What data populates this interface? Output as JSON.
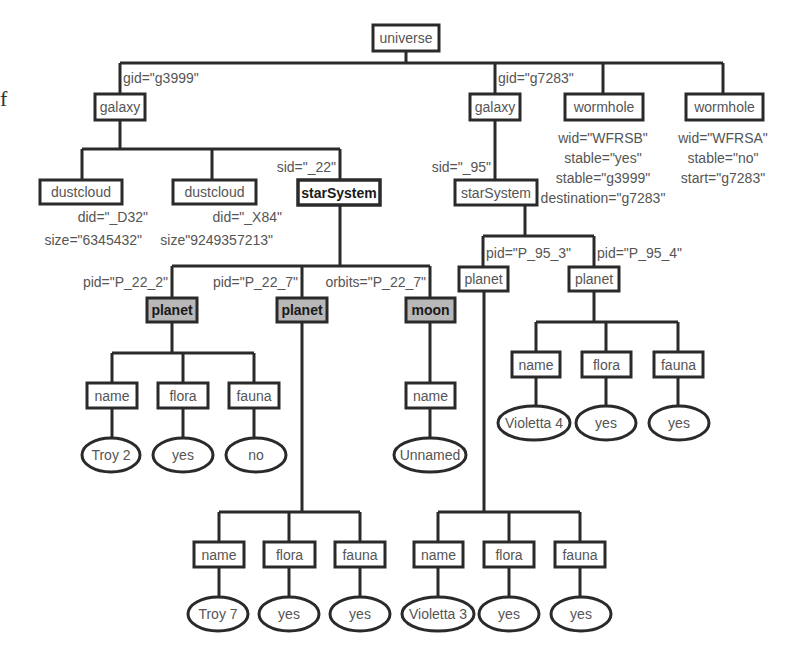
{
  "diagram": {
    "stray_glyph": "f",
    "colors": {
      "line": "#2a2a2a",
      "text": "#555555",
      "box_fill": "#ffffff",
      "highlight_fill": "#b8b8b8",
      "highlight_text": "#1a1a1a"
    },
    "nodes": [
      {
        "id": "universe",
        "label": "universe",
        "shape": "box",
        "x": 373,
        "y": 25,
        "w": 66,
        "h": 26
      },
      {
        "id": "galaxy1",
        "label": "galaxy",
        "shape": "box",
        "x": 95,
        "y": 94,
        "w": 50,
        "h": 26
      },
      {
        "id": "galaxy2",
        "label": "galaxy",
        "shape": "box",
        "x": 470,
        "y": 94,
        "w": 50,
        "h": 26
      },
      {
        "id": "wormhole1",
        "label": "wormhole",
        "shape": "box",
        "x": 565,
        "y": 94,
        "w": 78,
        "h": 26
      },
      {
        "id": "wormhole2",
        "label": "wormhole",
        "shape": "box",
        "x": 686,
        "y": 94,
        "w": 77,
        "h": 26
      },
      {
        "id": "dustcloud1",
        "label": "dustcloud",
        "shape": "box",
        "x": 40,
        "y": 180,
        "w": 82,
        "h": 24
      },
      {
        "id": "dustcloud2",
        "label": "dustcloud",
        "shape": "box",
        "x": 173,
        "y": 180,
        "w": 83,
        "h": 24
      },
      {
        "id": "starSystem1",
        "label": "starSystem",
        "shape": "box",
        "bold": true,
        "x": 298,
        "y": 180,
        "w": 82,
        "h": 25
      },
      {
        "id": "starSystem2",
        "label": "starSystem",
        "shape": "box",
        "x": 455,
        "y": 180,
        "w": 82,
        "h": 25
      },
      {
        "id": "planet1",
        "label": "planet",
        "shape": "box",
        "highlight": true,
        "x": 147,
        "y": 298,
        "w": 50,
        "h": 24
      },
      {
        "id": "planet2",
        "label": "planet",
        "shape": "box",
        "highlight": true,
        "x": 277,
        "y": 298,
        "w": 50,
        "h": 24
      },
      {
        "id": "moon",
        "label": "moon",
        "shape": "box",
        "highlight": true,
        "x": 406,
        "y": 298,
        "w": 49,
        "h": 24
      },
      {
        "id": "planet3",
        "label": "planet",
        "shape": "box",
        "x": 459,
        "y": 267,
        "w": 49,
        "h": 24
      },
      {
        "id": "planet4",
        "label": "planet",
        "shape": "box",
        "x": 569,
        "y": 267,
        "w": 50,
        "h": 24
      },
      {
        "id": "p1_name",
        "label": "name",
        "shape": "box",
        "x": 87,
        "y": 383,
        "w": 50,
        "h": 25
      },
      {
        "id": "p1_flora",
        "label": "flora",
        "shape": "box",
        "x": 158,
        "y": 383,
        "w": 50,
        "h": 25
      },
      {
        "id": "p1_fauna",
        "label": "fauna",
        "shape": "box",
        "x": 229,
        "y": 383,
        "w": 50,
        "h": 25
      },
      {
        "id": "p1_name_v",
        "label": "Troy 2",
        "shape": "ellipse",
        "cx": 111,
        "cy": 455,
        "rx": 29,
        "ry": 17
      },
      {
        "id": "p1_flora_v",
        "label": "yes",
        "shape": "ellipse",
        "cx": 183,
        "cy": 455,
        "rx": 30,
        "ry": 17
      },
      {
        "id": "p1_fauna_v",
        "label": "no",
        "shape": "ellipse",
        "cx": 256,
        "cy": 455,
        "rx": 30,
        "ry": 17
      },
      {
        "id": "m_name",
        "label": "name",
        "shape": "box",
        "x": 406,
        "y": 383,
        "w": 49,
        "h": 25
      },
      {
        "id": "m_name_v",
        "label": "Unnamed",
        "shape": "ellipse",
        "cx": 430,
        "cy": 455,
        "rx": 36,
        "ry": 17
      },
      {
        "id": "p4_name",
        "label": "name",
        "shape": "box",
        "x": 512,
        "y": 352,
        "w": 48,
        "h": 25
      },
      {
        "id": "p4_flora",
        "label": "flora",
        "shape": "box",
        "x": 582,
        "y": 352,
        "w": 49,
        "h": 25
      },
      {
        "id": "p4_fauna",
        "label": "fauna",
        "shape": "box",
        "x": 654,
        "y": 352,
        "w": 49,
        "h": 25
      },
      {
        "id": "p4_name_v",
        "label": "Violetta 4",
        "shape": "ellipse",
        "cx": 534,
        "cy": 423,
        "rx": 36,
        "ry": 17
      },
      {
        "id": "p4_flora_v",
        "label": "yes",
        "shape": "ellipse",
        "cx": 606,
        "cy": 423,
        "rx": 30,
        "ry": 17
      },
      {
        "id": "p4_fauna_v",
        "label": "yes",
        "shape": "ellipse",
        "cx": 679,
        "cy": 423,
        "rx": 30,
        "ry": 17
      },
      {
        "id": "p2_name",
        "label": "name",
        "shape": "box",
        "x": 194,
        "y": 542,
        "w": 50,
        "h": 25
      },
      {
        "id": "p2_flora",
        "label": "flora",
        "shape": "box",
        "x": 264,
        "y": 542,
        "w": 51,
        "h": 25
      },
      {
        "id": "p2_fauna",
        "label": "fauna",
        "shape": "box",
        "x": 335,
        "y": 542,
        "w": 50,
        "h": 25
      },
      {
        "id": "p2_name_v",
        "label": "Troy 7",
        "shape": "ellipse",
        "cx": 218,
        "cy": 614,
        "rx": 30,
        "ry": 17
      },
      {
        "id": "p2_flora_v",
        "label": "yes",
        "shape": "ellipse",
        "cx": 289,
        "cy": 614,
        "rx": 30,
        "ry": 17
      },
      {
        "id": "p2_fauna_v",
        "label": "yes",
        "shape": "ellipse",
        "cx": 360,
        "cy": 614,
        "rx": 30,
        "ry": 17
      },
      {
        "id": "p3_name",
        "label": "name",
        "shape": "box",
        "x": 414,
        "y": 542,
        "w": 49,
        "h": 25
      },
      {
        "id": "p3_flora",
        "label": "flora",
        "shape": "box",
        "x": 484,
        "y": 542,
        "w": 50,
        "h": 25
      },
      {
        "id": "p3_fauna",
        "label": "fauna",
        "shape": "box",
        "x": 555,
        "y": 542,
        "w": 50,
        "h": 25
      },
      {
        "id": "p3_name_v",
        "label": "Violetta 3",
        "shape": "ellipse",
        "cx": 438,
        "cy": 614,
        "rx": 36,
        "ry": 17
      },
      {
        "id": "p3_flora_v",
        "label": "yes",
        "shape": "ellipse",
        "cx": 509,
        "cy": 614,
        "rx": 30,
        "ry": 17
      },
      {
        "id": "p3_fauna_v",
        "label": "yes",
        "shape": "ellipse",
        "cx": 581,
        "cy": 614,
        "rx": 30,
        "ry": 17
      }
    ],
    "edges": [
      "M406,51 V63",
      "M120,63 H723",
      "M120,63 V94",
      "M495,63 V94",
      "M603,63 V94",
      "M723,63 V94",
      "M120,120 V149",
      "M82,149 H340",
      "M82,149 V180",
      "M212,149 V180",
      "M340,149 V180",
      "M495,120 V180",
      "M340,205 V266",
      "M172,266 H430",
      "M172,266 V298",
      "M302,266 V298",
      "M430,266 V298",
      "M525,205 V236",
      "M483,236 H594",
      "M483,236 V267",
      "M594,236 V267",
      "M172,322 V353",
      "M112,353 H254",
      "M112,353 V383",
      "M183,353 V383",
      "M254,353 V383",
      "M112,408 V438",
      "M183,408 V438",
      "M254,408 V438",
      "M430,322 V383",
      "M430,408 V438",
      "M594,291 V322",
      "M536,322 H678",
      "M536,322 V352",
      "M606,322 V352",
      "M678,322 V352",
      "M536,377 V406",
      "M606,377 V406",
      "M678,377 V406",
      "M302,322 V512",
      "M219,512 H360",
      "M219,512 V542",
      "M289,512 V542",
      "M360,512 V542",
      "M219,567 V597",
      "M289,567 V597",
      "M360,567 V597",
      "M484,291 V512",
      "M438,512 H580",
      "M438,512 V542",
      "M509,512 V542",
      "M580,512 V542",
      "M438,567 V597",
      "M509,567 V597",
      "M580,567 V597"
    ],
    "attributes": [
      {
        "for": "galaxy1",
        "text": "gid=\"g3999\"",
        "x": 123,
        "y": 83,
        "anchor": "start"
      },
      {
        "for": "galaxy2",
        "text": "gid=\"g7283\"",
        "x": 498,
        "y": 83,
        "anchor": "start"
      },
      {
        "for": "wormhole1",
        "text": "wid=\"WFRSB\"",
        "x": 603,
        "y": 143,
        "anchor": "middle"
      },
      {
        "for": "wormhole1",
        "text": "stable=\"yes\"",
        "x": 603,
        "y": 163,
        "anchor": "middle"
      },
      {
        "for": "wormhole1",
        "text": "stable=\"g3999\"",
        "x": 603,
        "y": 183,
        "anchor": "middle"
      },
      {
        "for": "wormhole1",
        "text": "destination=\"g7283\"",
        "x": 603,
        "y": 203,
        "anchor": "middle"
      },
      {
        "for": "wormhole2",
        "text": "wid=\"WFRSA\"",
        "x": 723,
        "y": 143,
        "anchor": "middle"
      },
      {
        "for": "wormhole2",
        "text": "stable=\"no\"",
        "x": 723,
        "y": 163,
        "anchor": "middle"
      },
      {
        "for": "wormhole2",
        "text": "start=\"g7283\"",
        "x": 723,
        "y": 183,
        "anchor": "middle"
      },
      {
        "for": "starSystem1",
        "text": "sid=\"_22\"",
        "x": 336,
        "y": 172,
        "anchor": "end"
      },
      {
        "for": "starSystem2",
        "text": "sid=\"_95\"",
        "x": 491,
        "y": 172,
        "anchor": "end"
      },
      {
        "for": "dustcloud1",
        "text": "did=\"_D32\"",
        "x": 148,
        "y": 222,
        "anchor": "end"
      },
      {
        "for": "dustcloud1",
        "text": "size=\"6345432\"",
        "x": 142,
        "y": 245,
        "anchor": "end"
      },
      {
        "for": "dustcloud2",
        "text": "did=\"_X84\"",
        "x": 282,
        "y": 222,
        "anchor": "end"
      },
      {
        "for": "dustcloud2",
        "text": "size\"9249357213\"",
        "x": 273,
        "y": 245,
        "anchor": "end"
      },
      {
        "for": "planet1",
        "text": "pid=\"P_22_2\"",
        "x": 168,
        "y": 287,
        "anchor": "end"
      },
      {
        "for": "planet2",
        "text": "pid=\"P_22_7\"",
        "x": 298,
        "y": 287,
        "anchor": "end"
      },
      {
        "for": "moon",
        "text": "orbits=\"P_22_7\"",
        "x": 426,
        "y": 287,
        "anchor": "end"
      },
      {
        "for": "planet3",
        "text": "pid=\"P_95_3\"",
        "x": 486,
        "y": 258,
        "anchor": "start"
      },
      {
        "for": "planet4",
        "text": "pid=\"P_95_4\"",
        "x": 597,
        "y": 258,
        "anchor": "start"
      }
    ]
  }
}
